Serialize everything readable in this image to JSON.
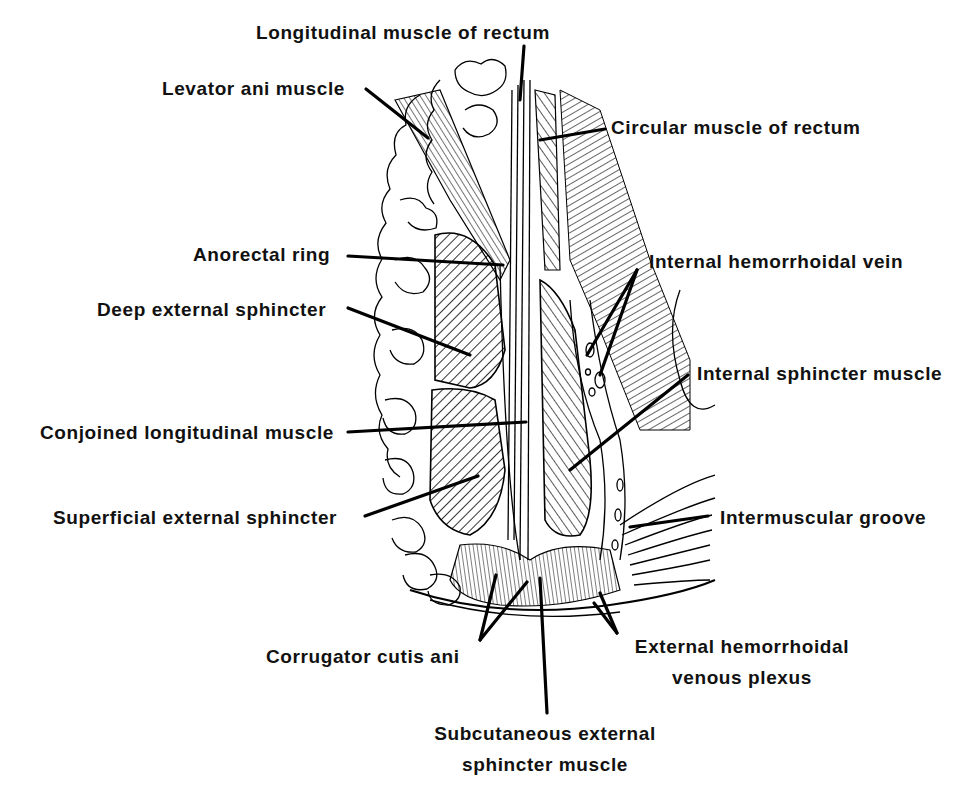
{
  "figure": {
    "type": "anatomical line illustration",
    "colors": {
      "ink": "#000000",
      "background": "#ffffff"
    }
  },
  "labels": {
    "longitudinal_muscle_of_rectum": "Longitudinal muscle of rectum",
    "levator_ani_muscle": "Levator ani muscle",
    "circular_muscle_of_rectum": "Circular muscle of rectum",
    "anorectal_ring": "Anorectal  ring",
    "internal_hemorrhoidal_vein": "Internal hemorrhoidal vein",
    "deep_external_sphincter": "Deep external sphincter",
    "internal_sphincter_muscle": "Internal sphincter muscle",
    "conjoined_longitudinal_muscle": "Conjoined longitudinal muscle",
    "superficial_external_sphincter": "Superficial external sphincter",
    "intermuscular_groove": "Intermuscular  groove",
    "corrugator_cutis_ani": "Corrugator cutis ani",
    "external_hemorrhoidal_venous_plexus_line1": "External hemorrhoidal",
    "external_hemorrhoidal_venous_plexus_line2": "venous plexus",
    "subcutaneous_external_sphincter_line1": "Subcutaneous external",
    "subcutaneous_external_sphincter_line2": "sphincter muscle"
  }
}
